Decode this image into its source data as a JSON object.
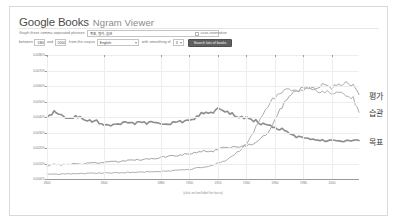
{
  "app": {
    "brand_google": "Google",
    "brand_books": "Books",
    "product": "Ngram Viewer"
  },
  "form": {
    "phrases_label": "Graph these comma-separated phrases:",
    "phrases_value": "목표, 평가, 습관",
    "case_insensitive_label": "case-insensitive",
    "between_label": "between",
    "year_start": "1800",
    "and_label": "and",
    "year_end": "2000",
    "corpus_label": "from the corpus",
    "corpus_value": "English",
    "smoothing_label": "with smoothing of",
    "smoothing_value": "3",
    "search_button": "Search lots of books"
  },
  "chart_data": {
    "type": "line",
    "title": "",
    "xlabel": "(click on line/label for focus)",
    "ylabel": "",
    "xlim": [
      1800,
      2019
    ],
    "ylim": [
      0.0,
      0.008
    ],
    "grid": true,
    "legend_position": "right-inline",
    "yticks": [
      "0.0080%",
      "0.0070%",
      "0.0060%",
      "0.0050%",
      "0.0040%",
      "0.0030%",
      "0.0020%",
      "0.0010%",
      "0.0000%"
    ],
    "ytick_values": [
      0.008,
      0.007,
      0.006,
      0.005,
      0.004,
      0.003,
      0.002,
      0.001,
      0.0
    ],
    "xticks": [
      "1800",
      "1840",
      "1880",
      "1900",
      "1920",
      "1940",
      "1960",
      "1980",
      "2000"
    ],
    "xtick_values": [
      1800,
      1840,
      1880,
      1900,
      1920,
      1940,
      1960,
      1980,
      2000
    ],
    "x": [
      1800,
      1805,
      1810,
      1815,
      1820,
      1825,
      1830,
      1835,
      1840,
      1845,
      1850,
      1855,
      1860,
      1865,
      1870,
      1875,
      1880,
      1885,
      1890,
      1895,
      1900,
      1905,
      1910,
      1915,
      1920,
      1925,
      1930,
      1935,
      1940,
      1945,
      1950,
      1955,
      1960,
      1965,
      1970,
      1975,
      1980,
      1985,
      1990,
      1995,
      2000,
      2005,
      2010,
      2015,
      2019
    ],
    "series": [
      {
        "name": "목표",
        "label": "목표",
        "color": "#8d8d8d",
        "width": 1.6,
        "values": [
          0.0041,
          0.0043,
          0.00405,
          0.00395,
          0.004,
          0.00392,
          0.0038,
          0.0037,
          0.00355,
          0.0035,
          0.00352,
          0.0036,
          0.00355,
          0.00368,
          0.00362,
          0.00366,
          0.00362,
          0.00358,
          0.0037,
          0.00372,
          0.00385,
          0.004,
          0.0043,
          0.0042,
          0.0046,
          0.0043,
          0.0042,
          0.004,
          0.00395,
          0.0038,
          0.0036,
          0.00355,
          0.0033,
          0.0032,
          0.00295,
          0.00275,
          0.00265,
          0.00258,
          0.00252,
          0.00248,
          0.00245,
          0.00244,
          0.00243,
          0.00242,
          0.00248
        ]
      },
      {
        "name": "평가",
        "label": "평가",
        "color": "#9a9a9a",
        "width": 0.9,
        "values": [
          0.00085,
          0.00095,
          0.0009,
          0.00095,
          0.001,
          0.00098,
          0.00102,
          0.00105,
          0.00108,
          0.0011,
          0.00112,
          0.00118,
          0.0012,
          0.00125,
          0.00128,
          0.00132,
          0.0014,
          0.00145,
          0.0015,
          0.00158,
          0.00165,
          0.00175,
          0.0018,
          0.00175,
          0.00195,
          0.002,
          0.00205,
          0.002,
          0.00215,
          0.0023,
          0.0026,
          0.003,
          0.0038,
          0.0047,
          0.0054,
          0.0057,
          0.0059,
          0.00585,
          0.006,
          0.00605,
          0.0059,
          0.006,
          0.00615,
          0.006,
          0.00545
        ]
      },
      {
        "name": "습관",
        "label": "습관",
        "color": "#a5a5a5",
        "width": 0.9,
        "values": [
          0.0003,
          0.00032,
          0.00031,
          0.00033,
          0.00034,
          0.00035,
          0.00036,
          0.00037,
          0.00038,
          0.0004,
          0.00041,
          0.00042,
          0.00044,
          0.00045,
          0.00046,
          0.00048,
          0.0005,
          0.00052,
          0.00055,
          0.00058,
          0.00062,
          0.0007,
          0.00078,
          0.00085,
          0.00105,
          0.0012,
          0.0015,
          0.0018,
          0.0023,
          0.003,
          0.004,
          0.0047,
          0.0053,
          0.0056,
          0.00575,
          0.0057,
          0.0058,
          0.00578,
          0.00572,
          0.00565,
          0.00558,
          0.00548,
          0.0054,
          0.0052,
          0.0043
        ]
      }
    ]
  }
}
